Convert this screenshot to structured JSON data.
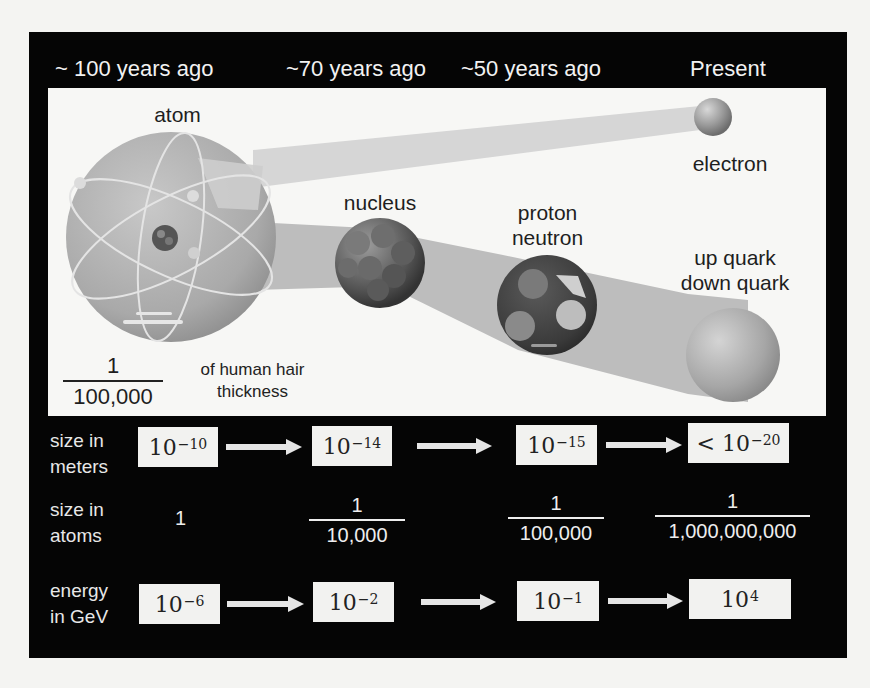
{
  "colors": {
    "panel_bg": "#050505",
    "stage_bg": "#f7f7f5",
    "cone_light": "#d6d6d6",
    "cone_dark": "#bdbdbd",
    "box_bg": "#f2f2f0",
    "arrow": "#e6e6e6"
  },
  "eras": [
    {
      "label": "~ 100 years ago"
    },
    {
      "label": "~70 years ago"
    },
    {
      "label": "~50 years ago"
    },
    {
      "label": "Present"
    }
  ],
  "particles": {
    "atom": {
      "label": "atom",
      "icon": "atom-icon"
    },
    "nucleus": {
      "label": "nucleus",
      "icon": "nucleus-icon"
    },
    "nucleon": {
      "line1": "proton",
      "line2": "neutron",
      "icon": "nucleon-icon"
    },
    "electron": {
      "label": "electron",
      "icon": "electron-icon"
    },
    "quark": {
      "line1": "up quark",
      "line2": "down quark",
      "icon": "quark-icon"
    }
  },
  "hair_note": {
    "numerator": "1",
    "denominator": "100,000",
    "text_line1": "of human hair",
    "text_line2": "thickness"
  },
  "rows": {
    "meters": {
      "label_line1": "size in",
      "label_line2": "meters",
      "values": [
        {
          "prefix": "",
          "base": "10",
          "exp": "−10"
        },
        {
          "prefix": "",
          "base": "10",
          "exp": "−14"
        },
        {
          "prefix": "",
          "base": "10",
          "exp": "−15"
        },
        {
          "prefix": "< ",
          "base": "10",
          "exp": "−20"
        }
      ]
    },
    "atoms": {
      "label_line1": "size in",
      "label_line2": "atoms",
      "values": [
        {
          "whole": "1"
        },
        {
          "numerator": "1",
          "denominator": "10,000"
        },
        {
          "numerator": "1",
          "denominator": "100,000"
        },
        {
          "numerator": "1",
          "denominator": "1,000,000,000"
        }
      ]
    },
    "energy": {
      "label_line1": "energy",
      "label_line2": "in GeV",
      "values": [
        {
          "base": "10",
          "exp": "−6"
        },
        {
          "base": "10",
          "exp": "−2"
        },
        {
          "base": "10",
          "exp": "−1"
        },
        {
          "base": "10",
          "exp": "4"
        }
      ]
    }
  }
}
